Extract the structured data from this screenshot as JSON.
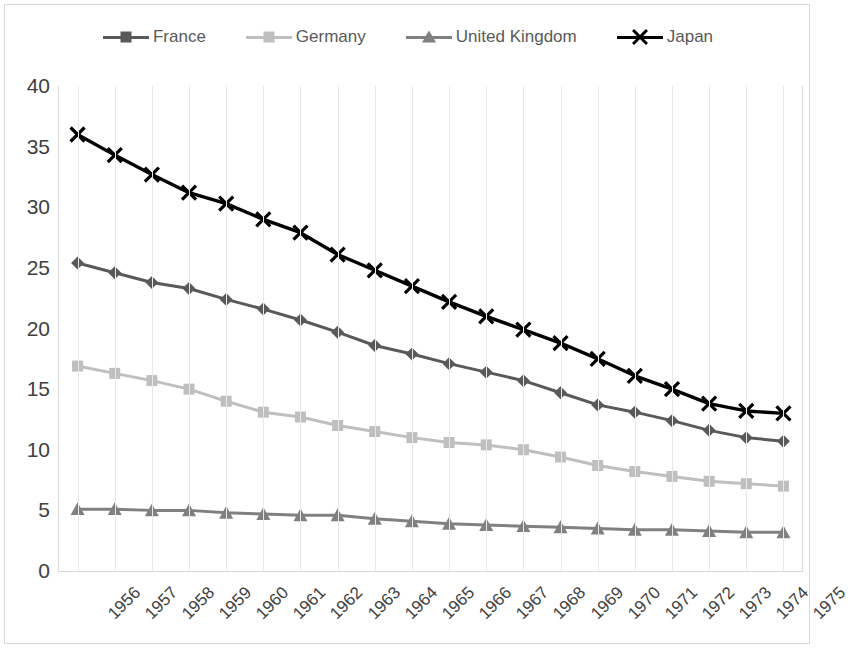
{
  "legend": {
    "position": "top",
    "entries": [
      {
        "label": "France",
        "marker": "diamond",
        "color": "#595959"
      },
      {
        "label": "Germany",
        "marker": "square",
        "color": "#bfbfbf"
      },
      {
        "label": "United Kingdom",
        "marker": "triangle",
        "color": "#808080"
      },
      {
        "label": "Japan",
        "marker": "cross",
        "color": "#000000"
      }
    ]
  },
  "axes": {
    "y_ticks": [
      "40",
      "35",
      "30",
      "25",
      "20",
      "15",
      "10",
      "5",
      "0"
    ],
    "x_ticks": [
      "1956",
      "1957",
      "1958",
      "1959",
      "1960",
      "1961",
      "1962",
      "1963",
      "1964",
      "1965",
      "1966",
      "1967",
      "1968",
      "1969",
      "1970",
      "1971",
      "1972",
      "1973",
      "1974",
      "1975"
    ]
  },
  "chart_data": {
    "type": "line",
    "title": "",
    "xlabel": "",
    "ylabel": "",
    "grid": "vertical",
    "legend_position": "top",
    "ylim": [
      0,
      40
    ],
    "ytick_step": 5,
    "categories": [
      "1956",
      "1957",
      "1958",
      "1959",
      "1960",
      "1961",
      "1962",
      "1963",
      "1964",
      "1965",
      "1966",
      "1967",
      "1968",
      "1969",
      "1970",
      "1971",
      "1972",
      "1973",
      "1974",
      "1975"
    ],
    "series": [
      {
        "name": "France",
        "color": "#595959",
        "marker": "diamond",
        "values": [
          25.4,
          24.6,
          23.8,
          23.3,
          22.4,
          21.6,
          20.7,
          19.7,
          18.6,
          17.9,
          17.1,
          16.4,
          15.7,
          14.7,
          13.7,
          13.1,
          12.4,
          11.6,
          11.0,
          10.7
        ]
      },
      {
        "name": "Germany",
        "color": "#bfbfbf",
        "marker": "square",
        "values": [
          16.9,
          16.3,
          15.7,
          15.0,
          14.0,
          13.1,
          12.7,
          12.0,
          11.5,
          11.0,
          10.6,
          10.4,
          10.0,
          9.4,
          8.7,
          8.2,
          7.8,
          7.4,
          7.2,
          7.0
        ]
      },
      {
        "name": "United Kingdom",
        "color": "#808080",
        "marker": "triangle",
        "values": [
          5.1,
          5.1,
          5.0,
          5.0,
          4.8,
          4.7,
          4.6,
          4.6,
          4.3,
          4.1,
          3.9,
          3.8,
          3.7,
          3.6,
          3.5,
          3.4,
          3.4,
          3.3,
          3.2,
          3.2
        ]
      },
      {
        "name": "Japan",
        "color": "#000000",
        "marker": "cross",
        "values": [
          36.0,
          34.3,
          32.7,
          31.2,
          30.3,
          29.0,
          27.9,
          26.1,
          24.8,
          23.5,
          22.2,
          21.0,
          19.9,
          18.8,
          17.5,
          16.1,
          15.0,
          13.8,
          13.2,
          13.0
        ]
      }
    ]
  }
}
